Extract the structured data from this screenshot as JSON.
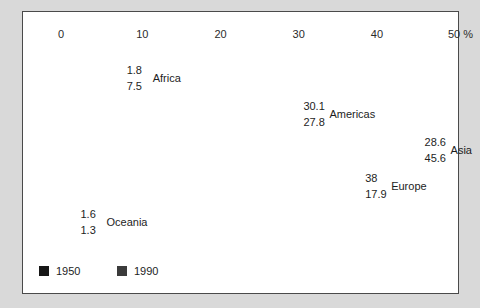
{
  "chart_data": {
    "type": "bar",
    "orientation": "horizontal",
    "title": "",
    "xlabel": "",
    "ylabel": "",
    "unit": "%",
    "xlim": [
      0,
      50
    ],
    "grid": false,
    "legend_position": "bottom-left",
    "axis": {
      "ticks": [
        {
          "label": "0",
          "value": 0
        },
        {
          "label": "10",
          "value": 10
        },
        {
          "label": "20",
          "value": 20
        },
        {
          "label": "30",
          "value": 30
        },
        {
          "label": "40",
          "value": 40
        },
        {
          "label": "50 %",
          "value": 50
        }
      ]
    },
    "categories": [
      "Africa",
      "Americas",
      "Asia",
      "Europe",
      "Oceania"
    ],
    "series": [
      {
        "name": "1950",
        "color": "#171717",
        "values": [
          1.8,
          30.1,
          28.6,
          38,
          1.6
        ],
        "value_labels": [
          "1.8",
          "30.1",
          "28.6",
          "38",
          "1.6"
        ]
      },
      {
        "name": "1990",
        "color": "#3b3b3b",
        "values": [
          7.5,
          27.8,
          45.6,
          17.9,
          1.3
        ],
        "value_labels": [
          "7.5",
          "27.8",
          "45.6",
          "17.9",
          "1.3"
        ]
      }
    ],
    "groups": [
      {
        "category": "Africa",
        "v1950": "1.8",
        "v1990": "7.5"
      },
      {
        "category": "Americas",
        "v1950": "30.1",
        "v1990": "27.8"
      },
      {
        "category": "Asia",
        "v1950": "28.6",
        "v1990": "45.6"
      },
      {
        "category": "Europe",
        "v1950": "38",
        "v1990": "17.9"
      },
      {
        "category": "Oceania",
        "v1950": "1.6",
        "v1990": "1.3"
      }
    ]
  },
  "legend": {
    "items": [
      {
        "label": "1950"
      },
      {
        "label": "1990"
      }
    ]
  },
  "colors": {
    "series_1950": "#171717",
    "series_1990": "#3b3b3b",
    "frame": "#4a4a4a",
    "page_background": "#d9d9d9",
    "plot_background": "#ffffff"
  }
}
